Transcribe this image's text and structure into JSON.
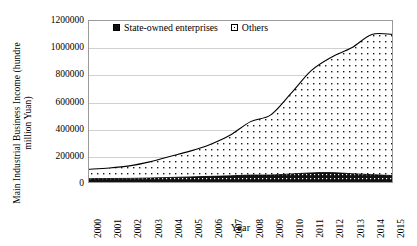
{
  "chart_data": {
    "type": "area",
    "stacked": true,
    "title": "",
    "xlabel": "Year",
    "ylabel": "Main Industrial Business Income (hundred million Yuan)",
    "ylabel_lines": [
      "Main Industrial Business Income (hundred",
      "million Yuan)"
    ],
    "grid": true,
    "legend_position": "top-left-inside",
    "categories": [
      2000,
      2001,
      2002,
      2003,
      2004,
      2005,
      2006,
      2007,
      2008,
      2009,
      2010,
      2011,
      2012,
      2013,
      2014,
      2015
    ],
    "xtick_labels": [
      "2000",
      "2001",
      "2002",
      "2003",
      "2004",
      "2005",
      "2006",
      "2007",
      "2008",
      "2009",
      "2010",
      "2011",
      "2012",
      "2013",
      "2014",
      "2015"
    ],
    "ylim": [
      0,
      1200000
    ],
    "ytick_labels": [
      "0",
      "200000",
      "400000",
      "600000",
      "800000",
      "1000000",
      "1200000"
    ],
    "ytick_values": [
      0,
      200000,
      400000,
      600000,
      800000,
      1000000,
      1200000
    ],
    "series": [
      {
        "name": "State-owned enterprises",
        "pattern": "dense-black",
        "color": "#111111",
        "values": [
          25000,
          26000,
          27000,
          30000,
          34000,
          38000,
          42000,
          46000,
          52000,
          52000,
          60000,
          68000,
          70000,
          62000,
          55000,
          48000
        ]
      },
      {
        "name": "Others",
        "pattern": "dotted-white",
        "color": "#ffffff",
        "values": [
          70000,
          78000,
          93000,
          120000,
          156000,
          192000,
          238000,
          304000,
          398000,
          448000,
          600000,
          762000,
          860000,
          938000,
          1045000,
          1052000
        ]
      }
    ],
    "totals": [
      95000,
      104000,
      120000,
      150000,
      190000,
      230000,
      280000,
      350000,
      450000,
      500000,
      660000,
      830000,
      930000,
      1000000,
      1100000,
      1100000
    ]
  },
  "legend": {
    "items": [
      {
        "label": "State-owned enterprises",
        "swatch": "filled-square-icon"
      },
      {
        "label": "Others",
        "swatch": "dotted-square-icon"
      }
    ]
  },
  "axes": {
    "x_title": "Year",
    "y_title_line1": "Main Industrial Business Income (hundre",
    "y_title_line2": "million Yuan)"
  }
}
